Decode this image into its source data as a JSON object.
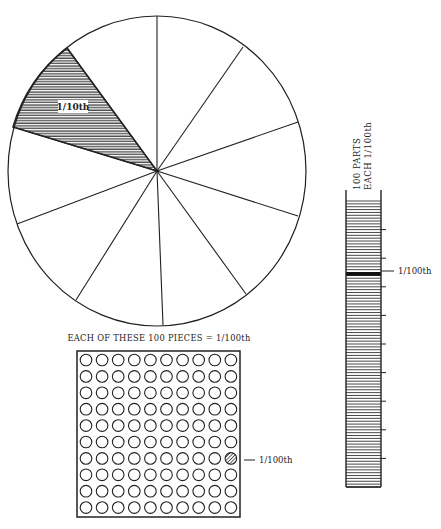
{
  "pie": {
    "slices": 10,
    "shaded_index": 8,
    "label": "1/10th"
  },
  "grid": {
    "caption": "EACH OF THESE 100 PIECES = 1/100th",
    "rows": 10,
    "cols": 10,
    "shaded_row": 6,
    "shaded_col": 9,
    "pointer_label": "1/100th"
  },
  "column": {
    "title_line1": "100 PARTS",
    "title_line2": "EACH 1/100th",
    "parts": 100,
    "ticks_every": 10,
    "highlighted_part": 25,
    "pointer_label": "1/100th"
  },
  "colors": {
    "ink": "#222222",
    "background": "#ffffff"
  }
}
